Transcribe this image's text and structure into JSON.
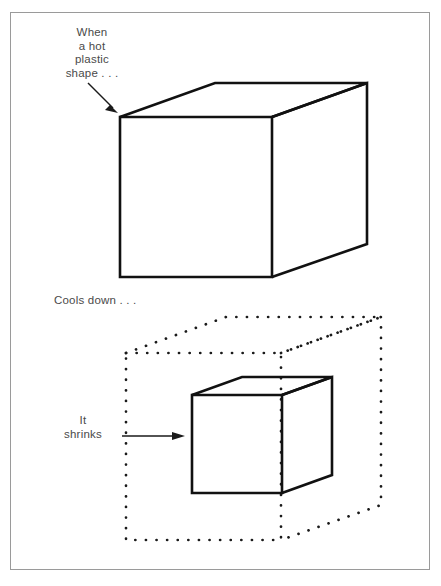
{
  "figure": {
    "frame_color": "#9a9a9a",
    "ink_color": "#111111",
    "text_color": "#4a4a4a",
    "background": "#ffffff"
  },
  "labels": {
    "hot_plastic": "When\na hot\nplastic\nshape . . .",
    "cools_down": "Cools down . . .",
    "it_shrinks": "It\nshrinks"
  },
  "icons": {
    "arrow_to_cube": "diagonal-arrow-icon",
    "arrow_to_small_cube": "horizontal-arrow-icon"
  },
  "shapes": {
    "large_cube": {
      "name": "large-solid-cube",
      "style": "solid",
      "front_face": {
        "left": 120,
        "top": 117,
        "right": 272,
        "bottom": 277
      },
      "depth_offset": {
        "dx": 95,
        "dy": -34
      }
    },
    "dotted_cube": {
      "name": "dotted-original-outline-cube",
      "style": "dotted",
      "front_face": {
        "left": 126,
        "top": 353,
        "right": 281,
        "bottom": 540
      },
      "depth_offset": {
        "dx": 100,
        "dy": -36
      }
    },
    "small_cube": {
      "name": "small-solid-cube",
      "style": "solid",
      "front_face": {
        "left": 192,
        "top": 395,
        "right": 282,
        "bottom": 493
      },
      "depth_offset": {
        "dx": 50,
        "dy": -18
      }
    }
  },
  "arrows": {
    "top_arrow": {
      "x1": 88,
      "y1": 83,
      "x2": 117,
      "y2": 112
    },
    "bottom_arrow": {
      "x1": 122,
      "y1": 436,
      "x2": 184,
      "y2": 436
    }
  }
}
